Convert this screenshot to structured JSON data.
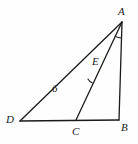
{
  "figure": {
    "type": "geometry-diagram",
    "background_color": "#fefefe",
    "stroke_color": "#1a1a1a",
    "vertices": [
      {
        "name": "A",
        "label": "A",
        "x": 122,
        "y": 22,
        "label_x": 118,
        "label_y": 6
      },
      {
        "name": "B",
        "label": "B",
        "x": 119,
        "y": 120,
        "label_x": 121,
        "label_y": 122
      },
      {
        "name": "C",
        "label": "C",
        "x": 76,
        "y": 120,
        "label_x": 72,
        "label_y": 126
      },
      {
        "name": "D",
        "label": "D",
        "x": 20,
        "y": 121,
        "label_x": 6,
        "label_y": 114
      },
      {
        "name": "E",
        "label": "E",
        "x": 97,
        "y": 73,
        "label_x": 92,
        "label_y": 56
      }
    ],
    "segments": [
      {
        "name": "segment-DB",
        "from": "D",
        "to": "B"
      },
      {
        "name": "segment-AB",
        "from": "A",
        "to": "B"
      },
      {
        "name": "segment-DA",
        "from": "D",
        "to": "A"
      },
      {
        "name": "segment-CA",
        "from": "C",
        "to": "A"
      }
    ],
    "measures": [
      {
        "name": "length-DE",
        "value": "6",
        "x": 52,
        "y": 83
      }
    ],
    "angle_marks": [
      {
        "name": "angle-mark-at-A",
        "vertex": "A",
        "between": [
          "E",
          "B"
        ]
      },
      {
        "name": "angle-mark-at-E",
        "vertex": "E",
        "between": [
          "D",
          "C"
        ]
      }
    ]
  }
}
